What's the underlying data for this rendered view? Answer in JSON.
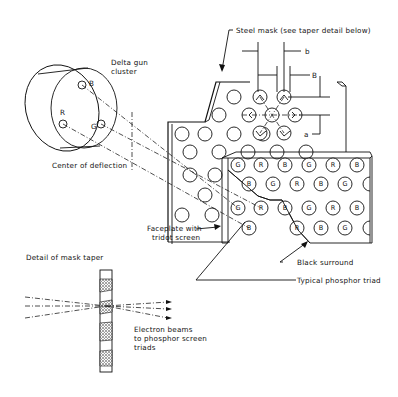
{
  "labels": {
    "delta_gun_line1": "Delta gun",
    "delta_gun_line2": "cluster",
    "center_of_deflection": "Center of deflection",
    "steel_mask": "Steel mask (see taper detail below)",
    "dim_b_lower": "b",
    "dim_b_upper": "B",
    "dim_a": "a",
    "faceplate_line1": "Faceplate with",
    "faceplate_line2": "tridot screen",
    "black_surround": "Black surround",
    "typical_triad": "Typical phosphor triad",
    "detail_taper": "Detail of mask taper",
    "electron_line1": "Electron beams",
    "electron_line2": "to phosphor screen",
    "electron_line3": "triads"
  },
  "guns": {
    "blue": "B",
    "red": "R",
    "green": "G"
  },
  "screen_rows": [
    [
      "G",
      "R",
      "B",
      "G",
      "R",
      "B"
    ],
    [
      "B",
      "G",
      "R",
      "B",
      "G"
    ],
    [
      "G",
      "R",
      "B",
      "G",
      "R",
      "B"
    ],
    [
      "B",
      "R",
      "B",
      "G"
    ]
  ]
}
